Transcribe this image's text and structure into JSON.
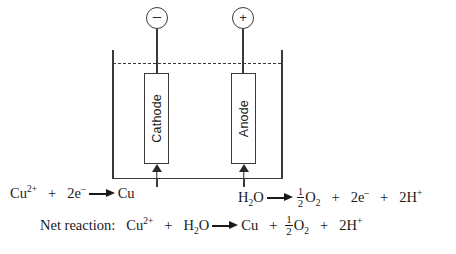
{
  "diagram": {
    "terminals": [
      {
        "name": "negative-terminal",
        "symbol": "–"
      },
      {
        "name": "positive-terminal",
        "symbol": "+"
      }
    ],
    "electrodes": [
      {
        "label": "Cathode",
        "polarity": "–"
      },
      {
        "label": "Anode",
        "polarity": "+"
      }
    ],
    "electrolyte_surface": "dashed-line",
    "colors": {
      "ink": "#1a1a1a",
      "line": "#3a3a3a",
      "background": "#ffffff"
    }
  },
  "equations": {
    "cathode_half": {
      "name": "cathode-half-reaction",
      "reactant_ion": "Cu",
      "reactant_ion_charge": "2+",
      "plus1": "+",
      "electrons": "2e",
      "electrons_charge": "–",
      "product": "Cu"
    },
    "anode_half": {
      "name": "anode-half-reaction",
      "reactant": "H",
      "reactant_sub": "2",
      "reactant_tail": "O",
      "frac_num": "1",
      "frac_den": "2",
      "oxygen": "O",
      "oxygen_sub": "2",
      "plus1": "+",
      "electrons": "2e",
      "electrons_charge": "–",
      "plus2": "+",
      "protons": "2H",
      "protons_charge": "+"
    },
    "net": {
      "name": "net-reaction",
      "label": "Net reaction:",
      "copper_ion": "Cu",
      "copper_ion_charge": "2+",
      "plus1": "+",
      "water": "H",
      "water_sub": "2",
      "water_tail": "O",
      "copper": "Cu",
      "plus2": "+",
      "frac_num": "1",
      "frac_den": "2",
      "oxygen": "O",
      "oxygen_sub": "2",
      "plus3": "+",
      "protons": "2H",
      "protons_charge": "+"
    }
  }
}
